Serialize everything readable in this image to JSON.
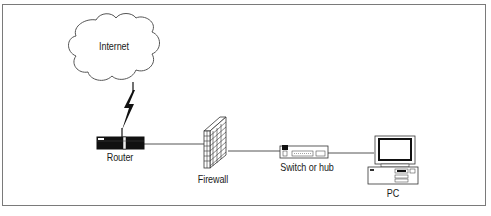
{
  "diagram": {
    "title": "",
    "nodes": [
      {
        "id": "internet",
        "label": "Internet",
        "shape": "cloud-icon"
      },
      {
        "id": "router",
        "label": "Router",
        "shape": "router-icon"
      },
      {
        "id": "firewall",
        "label": "Firewall",
        "shape": "brick-wall-icon"
      },
      {
        "id": "switch",
        "label": "Switch or hub",
        "shape": "switch-icon"
      },
      {
        "id": "pc",
        "label": "PC",
        "shape": "desktop-computer-icon"
      }
    ],
    "edges": [
      {
        "from": "internet",
        "to": "router",
        "style": "lightning-bolt (WAN link)"
      },
      {
        "from": "router",
        "to": "firewall",
        "style": "line"
      },
      {
        "from": "firewall",
        "to": "switch",
        "style": "line"
      },
      {
        "from": "switch",
        "to": "pc",
        "style": "line"
      }
    ],
    "colors": {
      "line": "#444444",
      "frame": "#7a7a7a",
      "fill": "#ffffff",
      "device_dark": "#111111"
    }
  }
}
